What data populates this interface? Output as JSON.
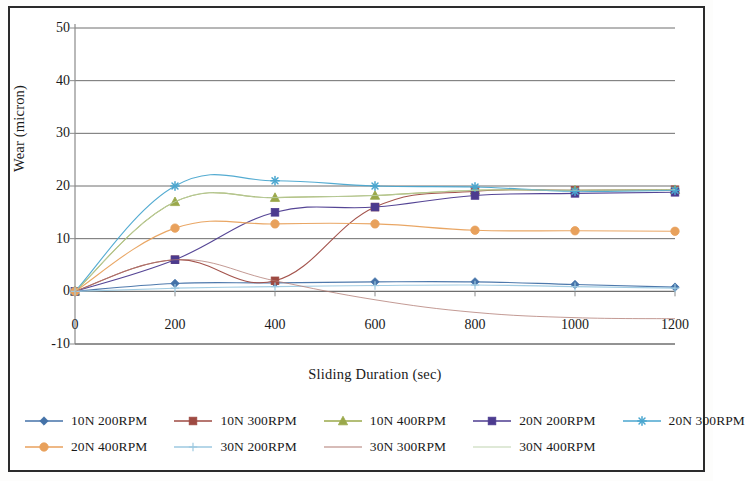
{
  "chart_data": {
    "type": "line",
    "title": "",
    "xlabel": "Sliding Duration (sec)",
    "ylabel": "Wear (micron)",
    "x": [
      0,
      200,
      400,
      600,
      800,
      1000,
      1200
    ],
    "xlim": [
      0,
      1200
    ],
    "ylim": [
      -10,
      50
    ],
    "xticks": [
      "0",
      "200",
      "400",
      "600",
      "800",
      "1000",
      "1200"
    ],
    "yticks": [
      "50",
      "40",
      "30",
      "20",
      "10",
      "0",
      "-10"
    ],
    "ytick_values": [
      50,
      40,
      30,
      20,
      10,
      0,
      -10
    ],
    "grid": "horizontal",
    "legend_position": "bottom",
    "series": [
      {
        "name": "10N 200RPM",
        "color": "#4472a8",
        "marker": "diamond",
        "values": [
          0,
          1.5,
          1.6,
          1.8,
          1.8,
          1.3,
          0.8
        ]
      },
      {
        "name": "10N 300RPM",
        "color": "#9e4a42",
        "marker": "square",
        "values": [
          0,
          6.0,
          2.0,
          16.0,
          19.0,
          19.2,
          19.3
        ]
      },
      {
        "name": "10N 400RPM",
        "color": "#9aa84a",
        "marker": "triangle",
        "values": [
          0,
          17.0,
          17.8,
          18.2,
          19.2,
          19.2,
          19.3
        ]
      },
      {
        "name": "20N 200RPM",
        "color": "#4c3b8f",
        "marker": "square",
        "values": [
          0,
          6.0,
          15.0,
          16.0,
          18.2,
          18.6,
          18.8
        ]
      },
      {
        "name": "20N 300RPM",
        "color": "#4aa6cf",
        "marker": "asterisk",
        "values": [
          0,
          20.0,
          21.0,
          20.0,
          19.8,
          19.0,
          19.2
        ]
      },
      {
        "name": "20N 400RPM",
        "color": "#e8a15c",
        "marker": "circle",
        "values": [
          0,
          12.0,
          12.8,
          12.8,
          11.6,
          11.5,
          11.4
        ]
      },
      {
        "name": "30N 200RPM",
        "color": "#9dc9e0",
        "marker": "plus",
        "values": [
          0,
          0.6,
          0.9,
          1.1,
          1.2,
          0.9,
          0.6
        ]
      },
      {
        "name": "30N 300RPM",
        "color": "#b07a72",
        "marker": "none",
        "values": [
          0,
          6.0,
          2.0,
          -1.6,
          -4.0,
          -5.0,
          -5.2
        ]
      },
      {
        "name": "30N 400RPM",
        "color": "#bfd3b0",
        "marker": "none",
        "values": [
          0,
          17.0,
          17.8,
          18.2,
          19.2,
          19.2,
          19.3
        ]
      }
    ]
  },
  "legend": {
    "rows": [
      [
        "10N 200RPM",
        "10N 300RPM",
        "10N 400RPM",
        "20N 200RPM",
        "20N 300RPM"
      ],
      [
        "20N 400RPM",
        "30N 200RPM",
        "30N 300RPM",
        "30N 400RPM"
      ]
    ]
  }
}
